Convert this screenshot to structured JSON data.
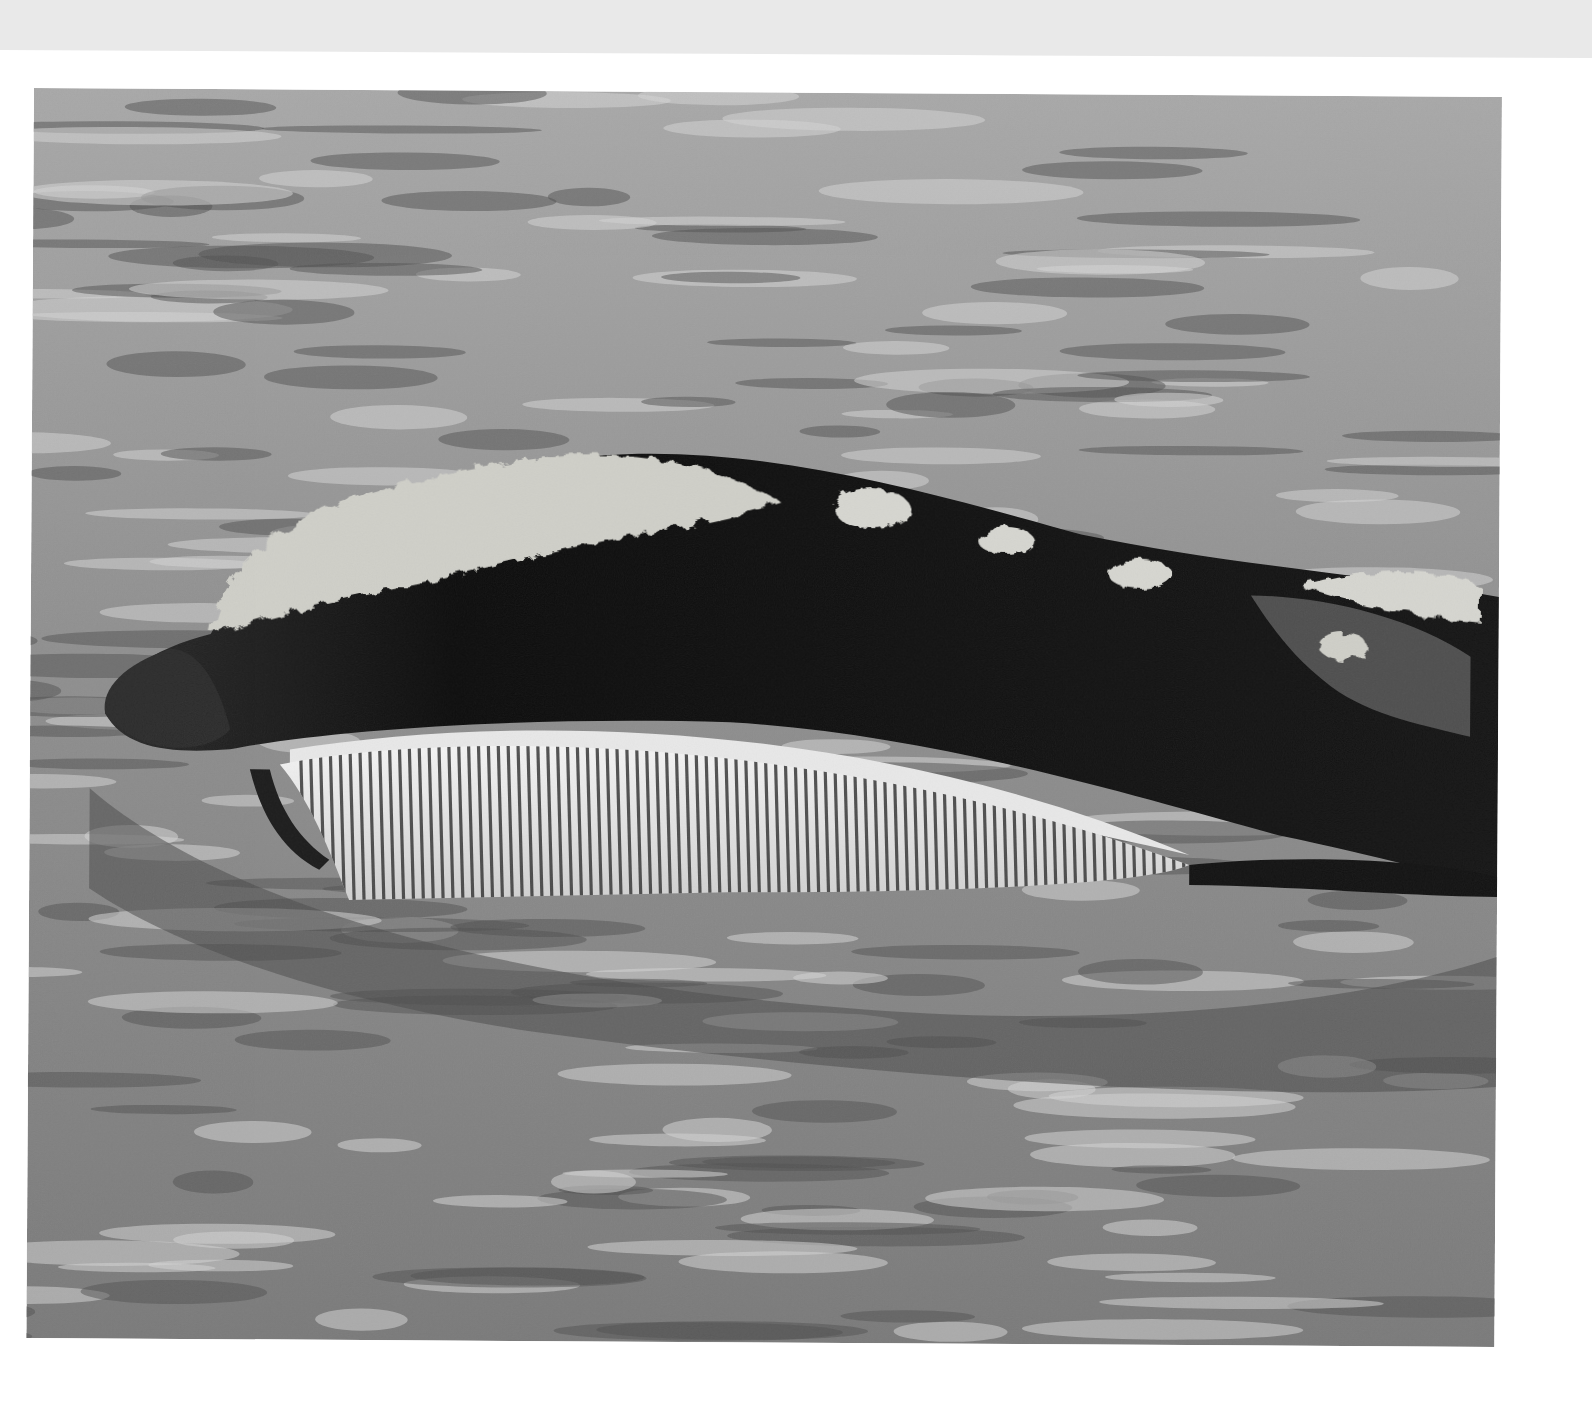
{
  "page": {
    "background": "#ffffff",
    "paper_strip_color": "#e9e9e9"
  },
  "photo": {
    "subject": "whale surfacing with mouth open showing baleen plates",
    "style": "black-and-white photograph",
    "colors": {
      "water_light": "#b9b9b9",
      "water_dark": "#5a5a5a",
      "whale_body": "#0c0c0c",
      "callosity": "#cfcfc8",
      "baleen_light": "#f2f2f2",
      "baleen_dark": "#333333"
    },
    "baleen_plate_count": 90
  }
}
